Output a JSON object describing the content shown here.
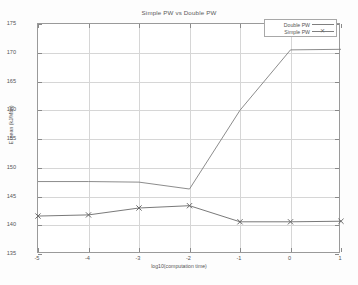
{
  "chart_data": {
    "type": "line",
    "title": "Simple PW vs Double PW",
    "xlabel": "log10(computation time)",
    "ylabel": "E mean (kJ/Mbit)",
    "x": [
      -5,
      -4,
      -3,
      -2,
      -1,
      0,
      1
    ],
    "xlim": [
      -5,
      1
    ],
    "ylim": [
      135,
      175
    ],
    "xticks": [
      "-5",
      "-4",
      "-3",
      "-2",
      "-1",
      "0",
      "1"
    ],
    "yticks": [
      "135",
      "140",
      "145",
      "150",
      "155",
      "160",
      "165",
      "170",
      "175"
    ],
    "grid": true,
    "legend_position": "top-right",
    "series": [
      {
        "name": "Double PW",
        "marker": "none",
        "color": "#7f7f7f",
        "values": [
          147.6,
          147.6,
          147.5,
          146.3,
          160.0,
          170.5,
          170.6
        ]
      },
      {
        "name": "Simple PW",
        "marker": "x",
        "color": "#6a6a6a",
        "values": [
          141.6,
          141.8,
          143.0,
          143.4,
          140.6,
          140.6,
          140.7
        ]
      }
    ]
  },
  "legend": {
    "entries": [
      {
        "label": "Double PW",
        "marker": ""
      },
      {
        "label": "Simple PW",
        "marker": "✕"
      }
    ]
  }
}
